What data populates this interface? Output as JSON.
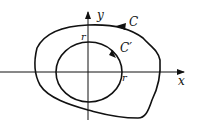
{
  "diagram": {
    "type": "contour-plot",
    "axes": {
      "x_label": "x",
      "y_label": "y"
    },
    "curves": [
      {
        "id": "outer",
        "label": "C",
        "description": "Closed curve enclosing origin, counterclockwise orientation"
      },
      {
        "id": "inner",
        "label": "C′",
        "description": "Circle of radius r centered at origin, counterclockwise orientation"
      }
    ],
    "radius_labels": {
      "top": "r",
      "right": "r"
    },
    "colors": {
      "stroke": "#111111",
      "background": "#ffffff"
    }
  }
}
